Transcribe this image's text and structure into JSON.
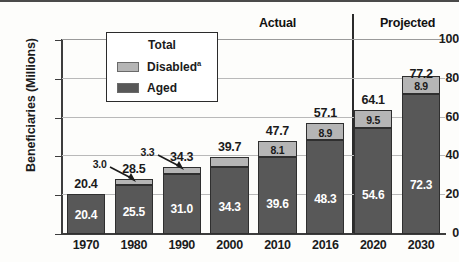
{
  "chart_data": {
    "type": "bar",
    "subtype": "stacked",
    "title": "",
    "xlabel": "",
    "ylabel": "Beneficiaries (Millions)",
    "ylim": [
      0,
      100
    ],
    "yticks": [
      0,
      20,
      40,
      60,
      80,
      100
    ],
    "grid": true,
    "categories": [
      "1970",
      "1980",
      "1990",
      "2000",
      "2010",
      "2016",
      "2020",
      "2030"
    ],
    "series": [
      {
        "name": "Aged",
        "color": "#585858",
        "values": [
          20.4,
          25.5,
          31.0,
          34.3,
          39.6,
          48.3,
          54.6,
          72.3
        ]
      },
      {
        "name": "Disabled",
        "color": "#b5b5b5",
        "values": [
          null,
          3.0,
          3.3,
          5.4,
          8.1,
          8.9,
          9.5,
          8.9
        ]
      }
    ],
    "totals": [
      20.4,
      28.5,
      34.3,
      39.7,
      47.7,
      57.1,
      64.1,
      77.2
    ],
    "legend": {
      "position": "top-left-inset",
      "title": "Total",
      "entries": [
        {
          "label": "Disabled",
          "footnote": "a",
          "color": "#b5b5b5"
        },
        {
          "label": "Aged",
          "footnote": "",
          "color": "#585858"
        }
      ]
    },
    "annotations": [
      {
        "text": "3.0",
        "target_category": "1980",
        "type": "arrow-callout"
      },
      {
        "text": "3.3",
        "target_category": "1990",
        "type": "arrow-callout"
      }
    ],
    "period_headers": [
      {
        "label": "Actual",
        "categories": [
          "1970",
          "1980",
          "1990",
          "2000",
          "2010",
          "2016"
        ]
      },
      {
        "label": "Projected",
        "categories": [
          "2020",
          "2030"
        ]
      }
    ]
  }
}
